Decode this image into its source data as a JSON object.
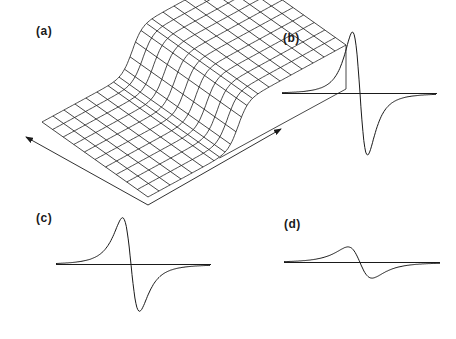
{
  "figure": {
    "panels": [
      {
        "id": "a",
        "label": "(a)",
        "type": "3d-surface",
        "description": "wireframe step surface with two arrows along base"
      },
      {
        "id": "b",
        "label": "(b)",
        "type": "derivative-lineshape",
        "amplitude": "large"
      },
      {
        "id": "c",
        "label": "(c)",
        "type": "derivative-lineshape",
        "amplitude": "medium"
      },
      {
        "id": "d",
        "label": "(d)",
        "type": "derivative-lineshape",
        "amplitude": "small"
      }
    ],
    "line_color": "#1a1a1a",
    "background": "#ffffff"
  }
}
